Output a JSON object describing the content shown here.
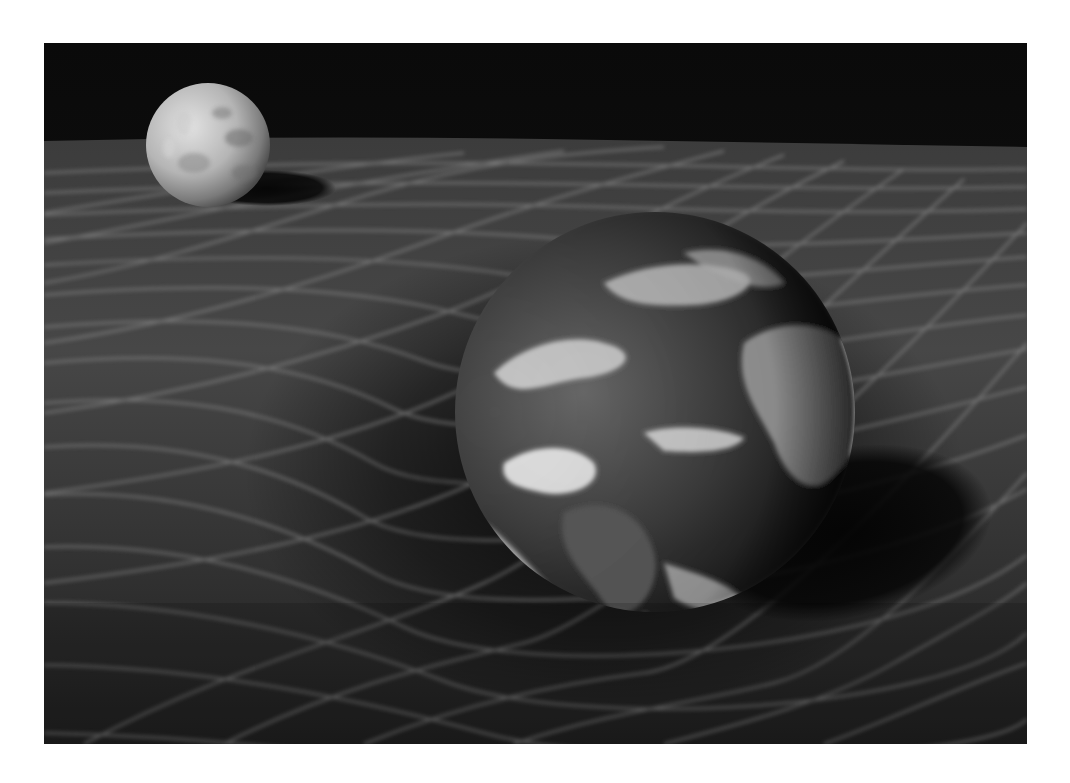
{
  "image": {
    "description": "Grayscale render of the Moon and Earth resting on a warped spacetime grid, illustrating gravity as curvature of spacetime",
    "palette": {
      "background": "#0e0e0e",
      "sky": "#0b0b0b",
      "grid_surface": "#3a3a3a",
      "grid_line": "#9a9a9a",
      "moon_light": "#d8d8d8",
      "moon_dark": "#555555",
      "earth_ocean": "#2e2e2e",
      "earth_cloud": "#e6e6e6",
      "shadow": "#050505"
    },
    "objects": [
      {
        "name": "moon",
        "cx": 164,
        "cy": 102,
        "r": 62
      },
      {
        "name": "earth",
        "cx": 611,
        "cy": 369,
        "r": 200
      }
    ]
  }
}
